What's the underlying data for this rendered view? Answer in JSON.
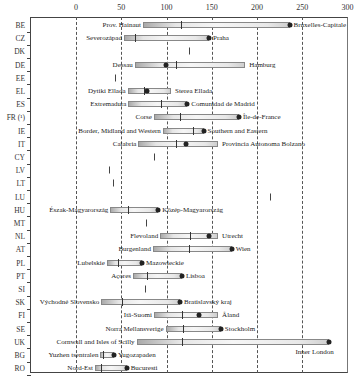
{
  "chart_data": {
    "type": "range-bar",
    "title": "",
    "xlabel": "",
    "ylabel": "",
    "xlim": [
      0,
      300
    ],
    "x_ticks": [
      0,
      50,
      100,
      150,
      200,
      250,
      300
    ],
    "grid": "vertical dashed",
    "categories": [
      "BE",
      "CZ",
      "DK",
      "DE",
      "EE",
      "EL",
      "ES",
      "FR (¹)",
      "IE",
      "IT",
      "CY",
      "LV",
      "LT",
      "LU",
      "HU",
      "MT",
      "NL",
      "AT",
      "PL",
      "PT",
      "SI",
      "SK",
      "FI",
      "SE",
      "UK",
      "BG",
      "RO"
    ],
    "rows": [
      {
        "country": "BE",
        "min": 74,
        "median": 116,
        "max": 236,
        "capital": 236,
        "min_label": "Prov. Hainaut",
        "max_label": "Bruxelles-Capitale"
      },
      {
        "country": "CZ",
        "min": 53,
        "median": 65,
        "max": 147,
        "capital": 147,
        "min_label": "Severozápad",
        "max_label": "Praha"
      },
      {
        "country": "DK",
        "single": 125
      },
      {
        "country": "DE",
        "min": 65,
        "median": 111,
        "max": 187,
        "capital": 99,
        "min_label": "Dessau",
        "max_label": "Hamburg"
      },
      {
        "country": "EE",
        "single": 43
      },
      {
        "country": "EL",
        "min": 57,
        "median": 75,
        "max": 105,
        "capital": 78,
        "min_label": "Dytiki Ellada",
        "max_label": "Sterea Ellada"
      },
      {
        "country": "ES",
        "min": 58,
        "median": 94,
        "max": 123,
        "capital": 123,
        "min_label": "Extremadura",
        "max_label": "Comunidad de Madrid"
      },
      {
        "country": "FR (¹)",
        "min": 86,
        "median": 115,
        "max": 180,
        "capital": 180,
        "min_label": "Corse",
        "max_label": "Île-de-France"
      },
      {
        "country": "IE",
        "min": 96,
        "median": 129,
        "max": 141,
        "capital": 141,
        "min_label": "Border, Midland and Western",
        "max_label": "Southern and Eastern"
      },
      {
        "country": "IT",
        "min": 69,
        "median": 110,
        "max": 157,
        "capital": 122,
        "min_label": "Calabria",
        "max_label": "Provincia Autonoma Bolzano"
      },
      {
        "country": "CY",
        "single": 86
      },
      {
        "country": "LV",
        "single": 36
      },
      {
        "country": "LT",
        "single": 41
      },
      {
        "country": "LU",
        "single": 214
      },
      {
        "country": "HU",
        "min": 38,
        "median": 57,
        "max": 91,
        "capital": 91,
        "min_label": "Észak-Magyarország",
        "max_label": "Közép-Magyarország"
      },
      {
        "country": "MT",
        "single": 77
      },
      {
        "country": "NL",
        "min": 93,
        "median": 126,
        "max": 157,
        "capital": 147,
        "min_label": "Flevoland",
        "max_label": "Utrecht"
      },
      {
        "country": "AT",
        "min": 85,
        "median": 125,
        "max": 172,
        "capital": 172,
        "min_label": "Burgenland",
        "max_label": "Wien"
      },
      {
        "country": "PL",
        "min": 34,
        "median": 46,
        "max": 73,
        "capital": 73,
        "min_label": "Lubelskie",
        "max_label": "Mazowieckie"
      },
      {
        "country": "PT",
        "min": 63,
        "median": 78,
        "max": 117,
        "capital": 117,
        "min_label": "Açores",
        "max_label": "Lisboa"
      },
      {
        "country": "SI",
        "single": 76
      },
      {
        "country": "SK",
        "min": 28,
        "median": 51,
        "max": 115,
        "capital": 115,
        "min_label": "Východné Slovensko",
        "max_label": "Bratislavský kraj"
      },
      {
        "country": "FI",
        "min": 86,
        "median": 117,
        "max": 157,
        "capital": 136,
        "min_label": "Itä-Suomi",
        "max_label": "Åland"
      },
      {
        "country": "SE",
        "min": 99,
        "median": 118,
        "max": 160,
        "capital": 160,
        "min_label": "Norra Mellansverige",
        "max_label": "Stockholm"
      },
      {
        "country": "UK",
        "min": 67,
        "median": 117,
        "max": 280,
        "capital": 280,
        "min_label": "Cornwall and Isles of Scilly",
        "max_label": "Inner London",
        "max_label_below": true
      },
      {
        "country": "BG",
        "min": 27,
        "median": 30,
        "max": 42,
        "capital": 42,
        "min_label": "Yuzhen tsentralen",
        "max_label": "Yugozapaden"
      },
      {
        "country": "RO",
        "min": 21,
        "median": 28,
        "max": 56,
        "capital": 56,
        "min_label": "Nord-Est",
        "max_label": "Bucuresti"
      }
    ]
  }
}
